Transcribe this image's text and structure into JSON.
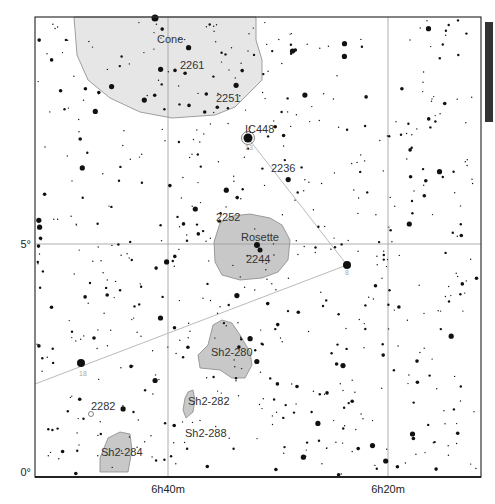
{
  "map": {
    "title": "Star chart: Monoceros region (Rosette / Cone)",
    "frame": {
      "x1": 35,
      "y1": 17,
      "x2": 481,
      "y2": 477
    },
    "ra_labels": [
      {
        "text": "6h40m",
        "x": 168
      },
      {
        "text": "6h20m",
        "x": 388
      }
    ],
    "dec_labels": [
      {
        "text": "5°",
        "y": 244
      },
      {
        "text": "0°",
        "y": 472
      }
    ],
    "scale_bar": {
      "x": 485,
      "y": 22,
      "w": 8,
      "h": 100,
      "color": "#333333"
    },
    "colors": {
      "nebula_fill": "#c8c8c8",
      "nebula_light_fill": "#e6e6e6",
      "nebula_stroke": "#888888",
      "grid": "#999999",
      "asterism_line": "#bbbbbb",
      "star": "#111111"
    }
  },
  "objects": [
    {
      "name": "Cone",
      "label_x": 157,
      "label_y": 43
    },
    {
      "name": "2261",
      "label_x": 180,
      "label_y": 69
    },
    {
      "name": "2251",
      "label_x": 216,
      "label_y": 102
    },
    {
      "name": "IC448",
      "label_x": 245,
      "label_y": 133
    },
    {
      "name": "2236",
      "label_x": 271,
      "label_y": 172
    },
    {
      "name": "2252",
      "label_x": 216,
      "label_y": 221
    },
    {
      "name": "Rosette",
      "label_x": 241,
      "label_y": 241
    },
    {
      "name": "2244",
      "label_x": 246,
      "label_y": 263
    },
    {
      "name": "Sh2-280",
      "label_x": 211,
      "label_y": 356
    },
    {
      "name": "Sh2-282",
      "label_x": 188,
      "label_y": 405
    },
    {
      "name": "2282",
      "label_x": 91,
      "label_y": 410
    },
    {
      "name": "Sh2-288",
      "label_x": 185,
      "label_y": 437
    },
    {
      "name": "Sh2-284",
      "label_x": 101,
      "label_y": 456
    }
  ],
  "magnitude_labels": [
    {
      "text": "13",
      "x": 245,
      "y": 150
    },
    {
      "text": "8",
      "x": 345,
      "y": 275
    },
    {
      "text": "18",
      "x": 79,
      "y": 376
    }
  ],
  "bright_stars": [
    {
      "x": 248,
      "y": 138,
      "r": 4.5
    },
    {
      "x": 347,
      "y": 265,
      "r": 4
    },
    {
      "x": 81,
      "y": 363,
      "r": 4
    },
    {
      "x": 257,
      "y": 245,
      "r": 3
    },
    {
      "x": 260,
      "y": 250,
      "r": 2.5
    },
    {
      "x": 155,
      "y": 18,
      "r": 3.5
    }
  ]
}
